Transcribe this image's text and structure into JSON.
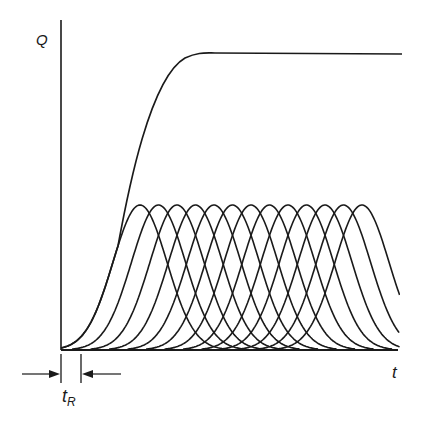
{
  "diagram": {
    "y_axis_label": "Q",
    "x_axis_label": "t",
    "interval_label_main": "t",
    "interval_label_sub": "R",
    "colors": {
      "ink": "#1a1a1a",
      "background": "#ffffff"
    },
    "geometry": {
      "origin": [
        61,
        350
      ],
      "y_axis_top": 20,
      "x_axis_end": 398,
      "plateau_y": 53,
      "plateau_end_x": 402,
      "bell_peak_y": 205,
      "bell_first_peak_x": 140,
      "bell_spacing": 18.5,
      "bell_count": 13,
      "bell_sigma": 27,
      "clip_right_x": 400,
      "tR_left_x": 60,
      "tR_right_x": 81
    }
  },
  "chart_data": {
    "type": "line",
    "title": "",
    "xlabel": "t",
    "ylabel": "Q",
    "series": [
      {
        "name": "cumulative Q",
        "description": "S-shaped rise from origin to a flat plateau"
      },
      {
        "name": "individual pulses",
        "count": 13,
        "description": "identical bell-shaped curves offset in time by t_R"
      }
    ],
    "annotations": [
      "t_R (offset between successive pulses)"
    ]
  }
}
